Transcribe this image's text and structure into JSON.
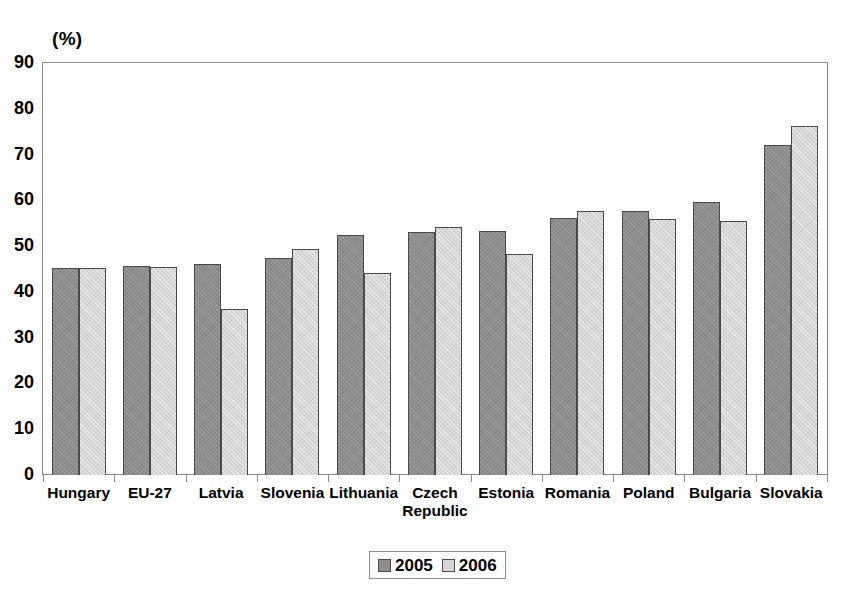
{
  "chart_data": {
    "type": "bar",
    "title": "",
    "subtitle": "",
    "xlabel": "",
    "ylabel": "(%)",
    "unit_label": "(%)",
    "ylim": [
      0,
      90
    ],
    "ytick_step": 10,
    "yticks": [
      "90",
      "80",
      "70",
      "60",
      "50",
      "40",
      "30",
      "20",
      "10",
      "0"
    ],
    "grid": false,
    "legend_position": "bottom-center",
    "categories": [
      "Hungary",
      "EU-27",
      "Latvia",
      "Slovenia",
      "Lithuania",
      "Czech\nRepublic",
      "Estonia",
      "Romania",
      "Poland",
      "Bulgaria",
      "Slovakia"
    ],
    "series": [
      {
        "name": "2005",
        "color": "#8d8d8d",
        "values": [
          45.3,
          45.7,
          46.0,
          47.4,
          52.5,
          53.0,
          53.4,
          56.2,
          57.6,
          59.7,
          72.0
        ]
      },
      {
        "name": "2006",
        "color": "#d6d6d6",
        "values": [
          45.3,
          45.5,
          36.2,
          49.3,
          44.1,
          54.2,
          48.2,
          57.6,
          56.0,
          55.4,
          76.2
        ]
      }
    ],
    "annotations": []
  },
  "legend": {
    "items": [
      {
        "label": "2005",
        "swatch": "dark-gray-swatch"
      },
      {
        "label": "2006",
        "swatch": "light-gray-swatch"
      }
    ]
  }
}
